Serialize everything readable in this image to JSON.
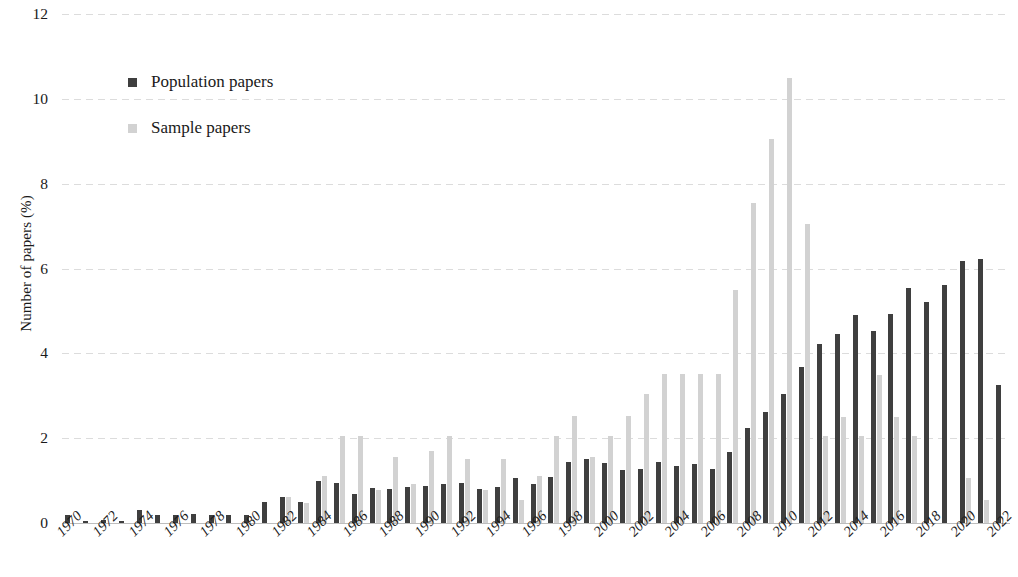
{
  "chart_data": {
    "type": "bar",
    "title": "",
    "xlabel": "",
    "ylabel": "Number of papers (%)",
    "ylim": [
      0,
      12
    ],
    "yticks": [
      0,
      2,
      4,
      6,
      8,
      10,
      12
    ],
    "grid": true,
    "legend_position": "upper-left",
    "colors": {
      "population": "#3f3f3f",
      "sample": "#d2d2d2"
    },
    "categories": [
      "1970",
      "1971",
      "1972",
      "1973",
      "1974",
      "1975",
      "1976",
      "1977",
      "1978",
      "1979",
      "1980",
      "1981",
      "1982",
      "1983",
      "1984",
      "1985",
      "1986",
      "1987",
      "1988",
      "1989",
      "1990",
      "1991",
      "1992",
      "1993",
      "1994",
      "1995",
      "1996",
      "1997",
      "1998",
      "1999",
      "2000",
      "2001",
      "2002",
      "2003",
      "2004",
      "2005",
      "2006",
      "2007",
      "2008",
      "2009",
      "2010",
      "2011",
      "2012",
      "2013",
      "2014",
      "2015",
      "2016",
      "2017",
      "2018",
      "2019",
      "2020",
      "2021",
      "2022"
    ],
    "tick_labels": [
      "1970",
      "1972",
      "1974",
      "1976",
      "1978",
      "1980",
      "1982",
      "1984",
      "1986",
      "1988",
      "1990",
      "1992",
      "1994",
      "1996",
      "1998",
      "2000",
      "2002",
      "2004",
      "2006",
      "2008",
      "2010",
      "2012",
      "2014",
      "2016",
      "2018",
      "2020",
      "2022"
    ],
    "series": [
      {
        "name": "Population papers",
        "values": [
          0.18,
          0.05,
          0.06,
          0.05,
          0.3,
          0.18,
          0.18,
          0.22,
          0.2,
          0.18,
          0.2,
          0.5,
          0.62,
          0.5,
          1.0,
          0.95,
          0.68,
          0.82,
          0.8,
          0.85,
          0.88,
          0.92,
          0.95,
          0.8,
          0.85,
          1.05,
          0.92,
          1.08,
          1.45,
          1.5,
          1.42,
          1.25,
          1.28,
          1.45,
          1.35,
          1.38,
          1.28,
          1.68,
          2.25,
          2.62,
          3.05,
          3.68,
          4.22,
          4.45,
          4.9,
          4.52,
          4.92,
          5.55,
          5.2,
          5.62,
          6.18,
          6.22,
          3.25
        ]
      },
      {
        "name": "Sample papers",
        "values": [
          0.0,
          0.0,
          0.0,
          0.0,
          0.0,
          0.0,
          0.0,
          0.0,
          0.0,
          0.0,
          0.0,
          0.0,
          0.62,
          0.48,
          1.1,
          2.05,
          2.05,
          0.78,
          1.55,
          0.92,
          1.7,
          2.05,
          1.5,
          0.78,
          1.5,
          0.55,
          1.12,
          2.05,
          2.52,
          1.55,
          2.05,
          2.52,
          3.05,
          3.52,
          3.52,
          3.52,
          3.52,
          5.5,
          7.55,
          9.05,
          10.5,
          7.05,
          2.05,
          2.5,
          2.05,
          3.5,
          2.5,
          2.05,
          0.0,
          0.0,
          1.05,
          0.55,
          0.0
        ]
      }
    ]
  },
  "legend": {
    "items": [
      {
        "label": "Population papers",
        "key": "pop"
      },
      {
        "label": "Sample papers",
        "key": "samp"
      }
    ]
  }
}
